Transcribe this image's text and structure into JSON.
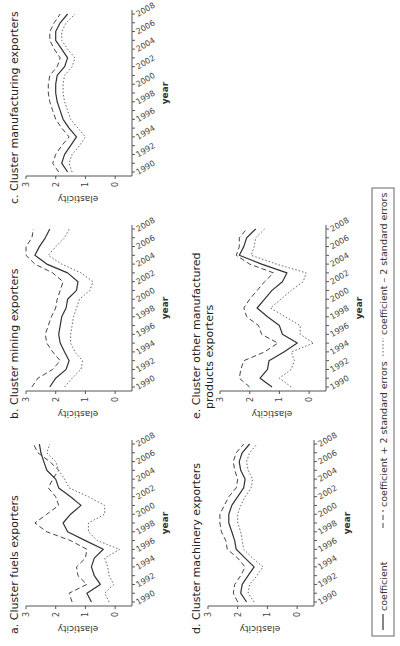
{
  "figure": {
    "rotation_deg": -90,
    "legend": {
      "items": [
        {
          "style": "solid",
          "label": "coefficient"
        },
        {
          "style": "dashed",
          "label": "coefficient + 2 standard errors"
        },
        {
          "style": "dotted",
          "label": "coefficient – 2 standard errors"
        }
      ]
    }
  },
  "chart_data": [
    {
      "type": "line",
      "id": "a",
      "title": "a. Cluster fuels exporters",
      "xlabel": "year",
      "ylabel": "elasticity",
      "x": [
        1990,
        1991,
        1992,
        1993,
        1994,
        1995,
        1996,
        1997,
        1998,
        1999,
        2000,
        2001,
        2002,
        2003,
        2004,
        2005,
        2006,
        2007,
        2008
      ],
      "xticks": [
        1990,
        1992,
        1994,
        1996,
        1998,
        2000,
        2002,
        2004,
        2006,
        2008
      ],
      "yticks": [
        0,
        1,
        2,
        3
      ],
      "ylim": [
        -0.5,
        3
      ],
      "series": [
        {
          "name": "coefficient",
          "values": [
            0.8,
            0.95,
            0.5,
            0.7,
            0.8,
            0.7,
            0.4,
            1.0,
            1.6,
            1.75,
            1.5,
            1.15,
            1.5,
            1.9,
            2.0,
            2.3,
            2.4,
            2.5,
            2.55
          ]
        },
        {
          "name": "coefficient + 2 standard errors",
          "values": [
            1.45,
            1.55,
            0.95,
            1.25,
            1.3,
            1.0,
            0.95,
            1.5,
            2.3,
            2.7,
            2.3,
            1.9,
            2.0,
            2.25,
            2.1,
            1.9,
            2.2,
            2.6,
            2.75
          ]
        },
        {
          "name": "coefficient - 2 standard errors",
          "values": [
            0.2,
            0.35,
            0.05,
            0.2,
            0.25,
            0.35,
            -0.15,
            0.6,
            0.9,
            0.9,
            0.35,
            0.35,
            0.9,
            1.55,
            1.7,
            1.9,
            2.0,
            2.3,
            2.2
          ]
        }
      ]
    },
    {
      "type": "line",
      "id": "b",
      "title": "b. Cluster mining exporters",
      "xlabel": "year",
      "ylabel": "elasticity",
      "x": [
        1990,
        1991,
        1992,
        1993,
        1994,
        1995,
        1996,
        1997,
        1998,
        1999,
        2000,
        2001,
        2002,
        2003,
        2004,
        2005,
        2006,
        2007,
        2008
      ],
      "xticks": [
        1990,
        1992,
        1994,
        1996,
        1998,
        2000,
        2002,
        2004,
        2006,
        2008
      ],
      "yticks": [
        0,
        1,
        2,
        3
      ],
      "ylim": [
        -0.5,
        3
      ],
      "series": [
        {
          "name": "coefficient",
          "values": [
            2.2,
            2.0,
            1.65,
            1.55,
            1.7,
            1.85,
            1.9,
            1.85,
            1.8,
            1.65,
            1.6,
            1.3,
            1.25,
            1.6,
            2.3,
            2.7,
            2.55,
            2.35,
            2.2
          ]
        },
        {
          "name": "coefficient + 2 standard errors",
          "values": [
            2.8,
            2.6,
            2.1,
            1.85,
            2.1,
            2.3,
            2.35,
            2.25,
            2.15,
            2.0,
            1.95,
            1.85,
            1.75,
            2.1,
            2.7,
            3.0,
            3.0,
            2.8,
            2.75
          ]
        },
        {
          "name": "coefficient - 2 standard errors",
          "values": [
            1.7,
            1.45,
            1.15,
            1.1,
            1.35,
            1.5,
            1.5,
            1.45,
            1.4,
            1.3,
            1.2,
            0.85,
            0.75,
            1.15,
            1.8,
            2.25,
            2.0,
            1.7,
            1.55
          ]
        }
      ]
    },
    {
      "type": "line",
      "id": "c",
      "title": "c. Cluster manufacturing exporters",
      "xlabel": "year",
      "ylabel": "elasticity",
      "x": [
        1990,
        1991,
        1992,
        1993,
        1994,
        1995,
        1996,
        1997,
        1998,
        1999,
        2000,
        2001,
        2002,
        2003,
        2004,
        2005,
        2006,
        2007,
        2008
      ],
      "xticks": [
        1990,
        1992,
        1994,
        1996,
        1998,
        2000,
        2002,
        2004,
        2006,
        2008
      ],
      "yticks": [
        0,
        1,
        2,
        3
      ],
      "ylim": [
        -0.5,
        3
      ],
      "series": [
        {
          "name": "coefficient",
          "values": [
            1.6,
            1.8,
            1.7,
            1.5,
            1.3,
            1.55,
            1.75,
            1.85,
            1.95,
            2.0,
            2.0,
            1.95,
            1.7,
            1.6,
            1.8,
            2.0,
            2.0,
            1.85,
            1.6
          ]
        },
        {
          "name": "coefficient + 2 standard errors",
          "values": [
            1.9,
            2.1,
            2.0,
            1.8,
            1.55,
            1.8,
            2.0,
            2.1,
            2.2,
            2.25,
            2.25,
            2.2,
            1.95,
            1.85,
            2.05,
            2.2,
            2.2,
            2.05,
            1.85
          ]
        },
        {
          "name": "coefficient - 2 standard errors",
          "values": [
            1.45,
            1.55,
            1.45,
            1.2,
            1.0,
            1.25,
            1.5,
            1.6,
            1.7,
            1.75,
            1.75,
            1.7,
            1.45,
            1.35,
            1.6,
            1.8,
            1.8,
            1.65,
            1.35
          ]
        }
      ]
    },
    {
      "type": "line",
      "id": "d",
      "title": "d. Cluster machinery exporters",
      "xlabel": "year",
      "ylabel": "elasticity",
      "x": [
        1990,
        1991,
        1992,
        1993,
        1994,
        1995,
        1996,
        1997,
        1998,
        1999,
        2000,
        2001,
        2002,
        2003,
        2004,
        2005,
        2006,
        2007,
        2008
      ],
      "xticks": [
        1990,
        1992,
        1994,
        1996,
        1998,
        2000,
        2002,
        2004,
        2006,
        2008
      ],
      "yticks": [
        0,
        1,
        2,
        3
      ],
      "ylim": [
        -0.5,
        3
      ],
      "series": [
        {
          "name": "coefficient",
          "values": [
            1.7,
            1.9,
            1.85,
            1.65,
            1.45,
            1.75,
            2.05,
            2.1,
            2.2,
            2.3,
            2.3,
            2.2,
            2.0,
            1.8,
            1.75,
            1.9,
            1.95,
            1.85,
            1.6
          ]
        },
        {
          "name": "coefficient + 2 standard errors",
          "values": [
            2.0,
            2.15,
            2.1,
            1.9,
            1.75,
            2.0,
            2.35,
            2.4,
            2.55,
            2.6,
            2.6,
            2.45,
            2.3,
            2.05,
            2.0,
            2.1,
            2.15,
            2.05,
            1.8
          ]
        },
        {
          "name": "coefficient - 2 standard errors",
          "values": [
            1.45,
            1.65,
            1.6,
            1.35,
            1.15,
            1.5,
            1.8,
            1.85,
            1.9,
            2.0,
            2.0,
            1.9,
            1.75,
            1.55,
            1.5,
            1.65,
            1.7,
            1.6,
            1.35
          ]
        }
      ]
    },
    {
      "type": "line",
      "id": "e",
      "title": "e. Cluster other manufactured",
      "title_line2": "products exporters",
      "xlabel": "year",
      "ylabel": "elasticity",
      "x": [
        1990,
        1991,
        1992,
        1993,
        1994,
        1995,
        1996,
        1997,
        1998,
        1999,
        2000,
        2001,
        2002,
        2003,
        2004,
        2005,
        2006,
        2007,
        2008
      ],
      "xticks": [
        1990,
        1992,
        1994,
        1996,
        1998,
        2000,
        2002,
        2004,
        2006,
        2008
      ],
      "yticks": [
        0,
        1,
        2,
        3
      ],
      "ylim": [
        -0.5,
        3
      ],
      "series": [
        {
          "name": "coefficient",
          "values": [
            1.25,
            1.65,
            1.4,
            1.35,
            0.85,
            0.4,
            0.9,
            1.0,
            1.4,
            1.75,
            1.5,
            1.25,
            0.9,
            0.75,
            1.6,
            2.35,
            2.2,
            2.1,
            1.8
          ]
        },
        {
          "name": "coefficient + 2 standard errors",
          "values": [
            2.0,
            2.35,
            2.3,
            2.2,
            1.5,
            1.05,
            1.6,
            1.7,
            2.1,
            2.2,
            2.0,
            1.75,
            1.5,
            1.2,
            2.0,
            2.45,
            2.35,
            2.35,
            2.1
          ]
        },
        {
          "name": "coefficient - 2 standard errors",
          "values": [
            0.6,
            1.0,
            0.6,
            0.5,
            0.6,
            -0.15,
            0.3,
            0.3,
            0.8,
            1.3,
            0.95,
            0.6,
            0.2,
            0.1,
            1.1,
            1.95,
            1.85,
            1.8,
            1.5
          ]
        }
      ]
    }
  ]
}
